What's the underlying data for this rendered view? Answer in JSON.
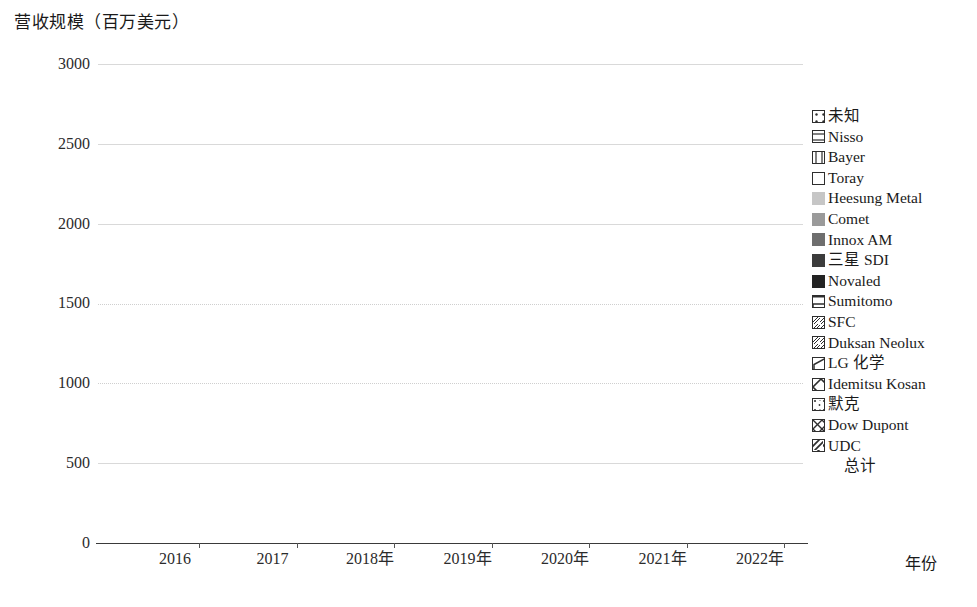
{
  "chart_data": {
    "type": "bar",
    "subtype": "stacked-bar",
    "title": "营收规模（百万美元）",
    "ylabel": "营收规模（百万美元）",
    "xlabel": "年份",
    "categories": [
      "2016",
      "2017",
      "2018年",
      "2019年",
      "2020年",
      "2021年",
      "2022年"
    ],
    "ylim": [
      0,
      3000
    ],
    "ytick_labels": [
      "0",
      "500",
      "1000",
      "1500",
      "2000",
      "2500",
      "3000"
    ],
    "ytick_values": [
      0,
      500,
      1000,
      1500,
      2000,
      2500,
      3000
    ],
    "grid": true,
    "legend_position": "right",
    "stack_order_bottom_to_top": [
      "UDC",
      "Dow Dupont",
      "默克",
      "Idemitsu Kosan",
      "LG 化学",
      "Duksan Neolux",
      "SFC",
      "Sumitomo",
      "Novaled",
      "三星 SDI",
      "Innox AM",
      "Comet",
      "Heesung Metal",
      "Toray",
      "Bayer",
      "Nisso",
      "未知"
    ],
    "series": [
      {
        "name": "UDC",
        "pattern": "diagonal-stripe",
        "values": [
          160,
          215,
          330,
          395,
          480,
          560,
          615
        ]
      },
      {
        "name": "Dow Dupont",
        "pattern": "crosshatch",
        "values": [
          60,
          85,
          120,
          145,
          170,
          185,
          200
        ]
      },
      {
        "name": "默克",
        "pattern": "sparse-dots",
        "values": [
          85,
          105,
          135,
          155,
          185,
          205,
          215
        ]
      },
      {
        "name": "Idemitsu Kosan",
        "pattern": "diamond-lattice",
        "values": [
          55,
          70,
          95,
          120,
          150,
          170,
          185
        ]
      },
      {
        "name": "LG 化学",
        "pattern": "hexagon",
        "values": [
          40,
          50,
          70,
          85,
          105,
          125,
          135
        ]
      },
      {
        "name": "Duksan Neolux",
        "pattern": "diagonal-thin",
        "values": [
          10,
          12,
          16,
          20,
          24,
          28,
          30
        ]
      },
      {
        "name": "SFC",
        "pattern": "diagonal-thin-2",
        "values": [
          10,
          12,
          16,
          20,
          24,
          28,
          30
        ]
      },
      {
        "name": "Sumitomo",
        "pattern": "brick",
        "values": [
          30,
          35,
          45,
          55,
          65,
          75,
          80
        ]
      },
      {
        "name": "Novaled",
        "pattern": "solid",
        "color": "#232323",
        "values": [
          40,
          48,
          65,
          80,
          95,
          110,
          118
        ]
      },
      {
        "name": "三星 SDI",
        "pattern": "solid",
        "color": "#3c3c3c",
        "values": [
          32,
          40,
          55,
          68,
          80,
          92,
          100
        ]
      },
      {
        "name": "Innox AM",
        "pattern": "solid",
        "color": "#6e6e6e",
        "values": [
          22,
          28,
          38,
          48,
          58,
          66,
          72
        ]
      },
      {
        "name": "Comet",
        "pattern": "solid",
        "color": "#9a9a9a",
        "values": [
          14,
          18,
          24,
          30,
          38,
          44,
          48
        ]
      },
      {
        "name": "Heesung Metal",
        "pattern": "solid",
        "color": "#c6c6c6",
        "values": [
          12,
          16,
          22,
          28,
          36,
          42,
          46
        ]
      },
      {
        "name": "Toray",
        "pattern": "blank",
        "values": [
          6,
          7,
          9,
          11,
          13,
          15,
          16
        ]
      },
      {
        "name": "Bayer",
        "pattern": "vertical-line",
        "values": [
          6,
          7,
          9,
          11,
          13,
          15,
          16
        ]
      },
      {
        "name": "Nisso",
        "pattern": "horizontal-line",
        "values": [
          5,
          6,
          8,
          10,
          12,
          14,
          15
        ]
      },
      {
        "name": "未知",
        "pattern": "dot-center",
        "values": [
          5,
          6,
          8,
          10,
          12,
          14,
          15
        ]
      }
    ],
    "totals": [
      592,
      755,
      1057,
      1281,
      1555,
      1775,
      1891
    ],
    "totals_label": "总计"
  },
  "legend": {
    "items": [
      {
        "label": "未知",
        "swatch": "dot-center-swatch"
      },
      {
        "label": "Nisso",
        "swatch": "horizontal-line-swatch"
      },
      {
        "label": "Bayer",
        "swatch": "vertical-line-swatch"
      },
      {
        "label": "Toray",
        "swatch": "blank-swatch"
      },
      {
        "label": "Heesung Metal",
        "swatch": "solid-swatch"
      },
      {
        "label": "Comet",
        "swatch": "solid-swatch"
      },
      {
        "label": "Innox AM",
        "swatch": "solid-swatch"
      },
      {
        "label": "三星 SDI",
        "swatch": "solid-swatch"
      },
      {
        "label": "Novaled",
        "swatch": "solid-swatch"
      },
      {
        "label": "Sumitomo",
        "swatch": "brick-swatch"
      },
      {
        "label": "SFC",
        "swatch": "diagonal-swatch"
      },
      {
        "label": "Duksan Neolux",
        "swatch": "diagonal-swatch"
      },
      {
        "label": "LG 化学",
        "swatch": "hexagon-swatch"
      },
      {
        "label": "Idemitsu Kosan",
        "swatch": "diamond-swatch"
      },
      {
        "label": "默克",
        "swatch": "dots-swatch"
      },
      {
        "label": "Dow Dupont",
        "swatch": "crosshatch-swatch"
      },
      {
        "label": "UDC",
        "swatch": "diagonal-stripe-swatch"
      },
      {
        "label": "总计",
        "swatch": "none"
      }
    ]
  },
  "colors": {
    "axis": "#2b2b2b",
    "grid": "#d9d9d9",
    "novaled": "#232323",
    "samsung_sdi": "#3c3c3c",
    "innox_am": "#6e6e6e",
    "comet": "#9a9a9a",
    "heesung_metal": "#c6c6c6",
    "background": "#ffffff"
  }
}
